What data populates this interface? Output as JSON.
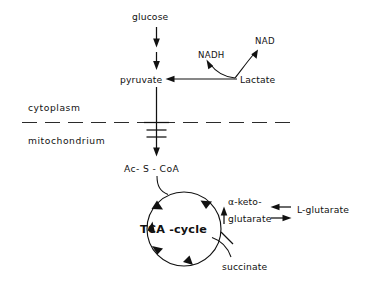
{
  "diagram": {
    "background_color": "#ffffff",
    "ink_color": "#111111",
    "compartments": {
      "upper_label": "cytoplasm",
      "lower_label": "mitochondrium",
      "membrane_style": "dashed"
    },
    "nodes": {
      "glucose": "glucose",
      "pyruvate": "pyruvate",
      "lactate": "Lactate",
      "nadh": "NADH",
      "nad": "NAD",
      "acetyl_coa": "Ac- S - CoA",
      "cycle": "TCA -cycle",
      "alpha_keto_line1": "α-keto-",
      "alpha_keto_line2": "glutarate",
      "l_glutarate": "L-glutarate",
      "succinate": "succinate"
    },
    "edges": [
      {
        "name": "glucose-to-pyruvate-step-1",
        "from": "glucose",
        "to": "pyruvate",
        "direction": "down",
        "style": "solid-arrow"
      },
      {
        "name": "glucose-to-pyruvate-step-2",
        "from": "glucose",
        "to": "pyruvate",
        "direction": "down",
        "style": "solid-arrow"
      },
      {
        "name": "lactate-to-pyruvate",
        "from": "Lactate",
        "to": "pyruvate",
        "direction": "left",
        "style": "solid-arrow"
      },
      {
        "name": "lactate-to-nadh",
        "from": "Lactate",
        "to": "NADH",
        "direction": "up-left",
        "style": "curved-arrow"
      },
      {
        "name": "lactate-to-nad",
        "from": "Lactate",
        "to": "NAD",
        "direction": "up-right",
        "style": "curved-arrow"
      },
      {
        "name": "pyruvate-across-membrane",
        "from": "pyruvate",
        "to": "Ac- S - CoA",
        "direction": "down",
        "style": "solid-arrow-with-block-bars",
        "block_bar_count": 3
      },
      {
        "name": "acetyl-coa-into-cycle",
        "from": "Ac- S - CoA",
        "to": "TCA -cycle",
        "direction": "curve-right-down",
        "style": "curved-arrow"
      },
      {
        "name": "cycle-to-alpha-ketoglutarate",
        "from": "TCA -cycle",
        "to": "α-ketoglutarate",
        "direction": "up",
        "style": "solid-arrow"
      },
      {
        "name": "l-glutarate-to-alpha-ketoglutarate",
        "from": "L-glutarate",
        "to": "α-ketoglutarate",
        "direction": "left",
        "style": "solid-arrow"
      },
      {
        "name": "alpha-ketoglutarate-to-l-glutarate",
        "from": "α-ketoglutarate",
        "to": "L-glutarate",
        "direction": "right",
        "style": "solid-arrow"
      },
      {
        "name": "succinate-branch-blocked",
        "from": "α-ketoglutarate",
        "to": "succinate",
        "direction": "down-curve",
        "style": "blocked-single-bar",
        "block_bar_count": 1
      }
    ],
    "cycle": {
      "label": "TCA -cycle",
      "rotation": "clockwise",
      "arrowhead_count": 5
    }
  }
}
